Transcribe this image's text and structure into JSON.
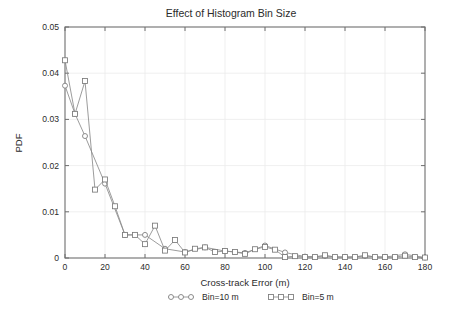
{
  "chart_data": {
    "type": "line",
    "title": "Effect of Histogram Bin Size",
    "xlabel": "Cross-track Error (m)",
    "ylabel": "PDF",
    "xlim": [
      0,
      180
    ],
    "ylim": [
      0,
      0.05
    ],
    "xticks": [
      0,
      20,
      40,
      60,
      80,
      100,
      120,
      140,
      160,
      180
    ],
    "xtick_labels": [
      "0",
      "20",
      "40",
      "60",
      "80",
      "100",
      "120",
      "140",
      "160",
      "180"
    ],
    "yticks": [
      0,
      0.01,
      0.02,
      0.03,
      0.04,
      0.05
    ],
    "ytick_labels": [
      "0",
      "0.01",
      "0.02",
      "0.03",
      "0.04",
      "0.05"
    ],
    "grid": true,
    "legend_position": "below-axes",
    "marker_colors": {
      "line": "#8a8a8a",
      "marker_edge": "#7a7a7a",
      "marker_face": "#ffffff",
      "grid": "#ebebeb",
      "frame": "#6e6e6e",
      "text": "#2b2b2b",
      "background": "#ffffff"
    },
    "series": [
      {
        "name": "Bin=10 m",
        "marker": "circle",
        "x": [
          0,
          5,
          10,
          20,
          30,
          40,
          50,
          60,
          70,
          80,
          90,
          100,
          110,
          120,
          130,
          140,
          150,
          160,
          170,
          180
        ],
        "values": [
          0.0373,
          0.0312,
          0.0264,
          0.0161,
          0.005,
          0.005,
          0.002,
          0.0013,
          0.0023,
          0.0015,
          0.0011,
          0.0027,
          0.0012,
          0.0003,
          0.0004,
          0.0002,
          0.0004,
          0.0002,
          0.0008,
          0.0001
        ]
      },
      {
        "name": "Bin=5 m",
        "marker": "square",
        "x": [
          0,
          5,
          10,
          15,
          20,
          25,
          30,
          35,
          40,
          45,
          50,
          55,
          60,
          65,
          70,
          75,
          80,
          85,
          90,
          95,
          100,
          105,
          110,
          115,
          120,
          125,
          130,
          135,
          140,
          145,
          150,
          155,
          160,
          165,
          170,
          175,
          180
        ],
        "values": [
          0.0428,
          0.0312,
          0.0383,
          0.0148,
          0.017,
          0.0112,
          0.005,
          0.005,
          0.003,
          0.007,
          0.0016,
          0.0039,
          0.0012,
          0.002,
          0.0023,
          0.0013,
          0.0015,
          0.0013,
          0.0009,
          0.0019,
          0.0024,
          0.0018,
          0.0002,
          0.0004,
          0.0002,
          0.0002,
          0.0006,
          0.0002,
          0.0002,
          0.0002,
          0.0006,
          0.0002,
          0.0002,
          0.0002,
          0.0005,
          0.0002,
          0.0001
        ]
      }
    ]
  },
  "legend": {
    "entries": [
      {
        "label": "Bin=10 m",
        "marker": "circle"
      },
      {
        "label": "Bin=5 m",
        "marker": "square"
      }
    ]
  }
}
